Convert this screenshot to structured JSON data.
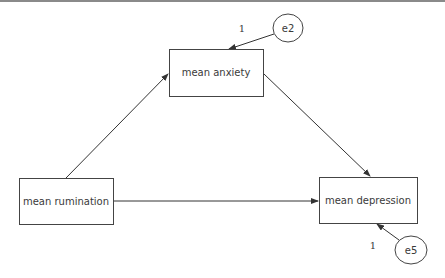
{
  "diagram": {
    "type": "path-model",
    "nodes": {
      "anxiety": {
        "label": "mean anxiety",
        "shape": "rectangle"
      },
      "rumination": {
        "label": "mean rumination",
        "shape": "rectangle"
      },
      "depression": {
        "label": "mean depression",
        "shape": "rectangle"
      },
      "e2": {
        "label": "e2",
        "shape": "ellipse"
      },
      "e5": {
        "label": "e5",
        "shape": "ellipse"
      }
    },
    "edges": [
      {
        "from": "rumination",
        "to": "anxiety"
      },
      {
        "from": "anxiety",
        "to": "depression"
      },
      {
        "from": "rumination",
        "to": "depression"
      },
      {
        "from": "e2",
        "to": "anxiety",
        "label": "1"
      },
      {
        "from": "e5",
        "to": "depression",
        "label": "1"
      }
    ],
    "labels": {
      "e2_weight": "1",
      "e5_weight": "1"
    },
    "colors": {
      "line": "#333333",
      "text": "#3a3a3a",
      "background": "#ffffff"
    }
  }
}
